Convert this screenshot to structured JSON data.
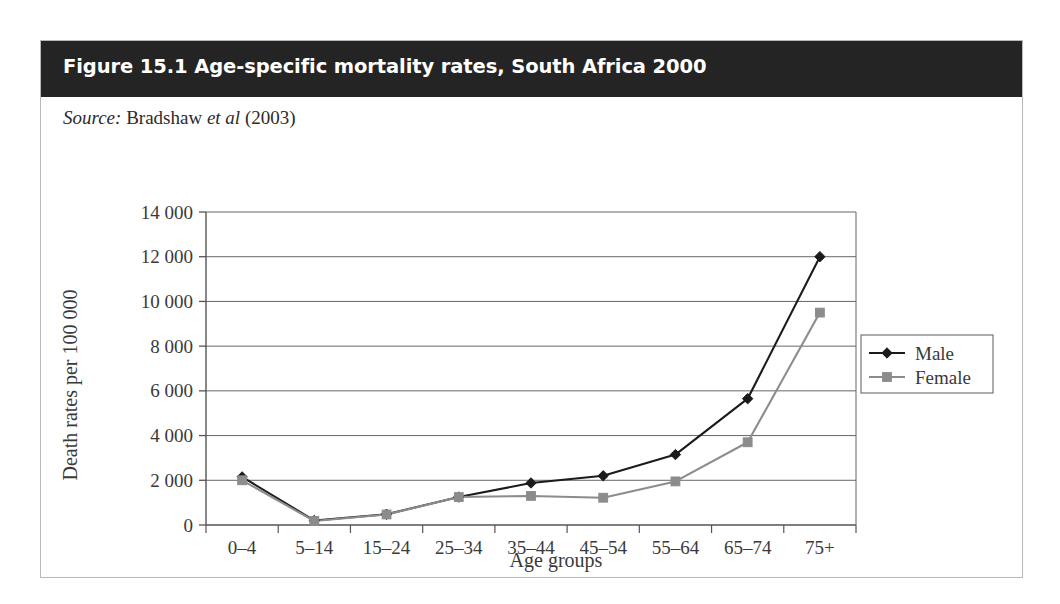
{
  "figure": {
    "title": "Figure 15.1 Age-specific mortality rates, South Africa 2000",
    "source_prefix": "Source:",
    "source_author": "Bradshaw",
    "source_etal": "et al",
    "source_year": "(2003)"
  },
  "colors": {
    "header_bg": "#242424",
    "card_border": "#b9b9b9",
    "male_line": "#1b1b1b",
    "female_line": "#8c8c8c",
    "axis": "#555555",
    "gridline": "#666666",
    "text": "#3a3a3a"
  },
  "chart_data": {
    "type": "line",
    "title": "Age-specific mortality rates, South Africa 2000",
    "xlabel": "Age groups",
    "ylabel": "Death rates per 100 000",
    "categories": [
      "0–4",
      "5–14",
      "15–24",
      "25–34",
      "35–44",
      "45–54",
      "55–64",
      "65–74",
      "75+"
    ],
    "ytick_labels": [
      "0",
      "2 000",
      "4 000",
      "6 000",
      "8 000",
      "10 000",
      "12 000",
      "14 000"
    ],
    "ytick_values": [
      0,
      2000,
      4000,
      6000,
      8000,
      10000,
      12000,
      14000
    ],
    "ylim": [
      0,
      14000
    ],
    "grid": true,
    "legend_position": "right",
    "series": [
      {
        "name": "Male",
        "marker": "diamond",
        "color": "#1b1b1b",
        "values": [
          2150,
          200,
          480,
          1250,
          1880,
          2200,
          3150,
          5650,
          12000
        ]
      },
      {
        "name": "Female",
        "marker": "square",
        "color": "#8c8c8c",
        "values": [
          2000,
          180,
          470,
          1250,
          1300,
          1220,
          1950,
          3700,
          9500
        ]
      }
    ]
  }
}
